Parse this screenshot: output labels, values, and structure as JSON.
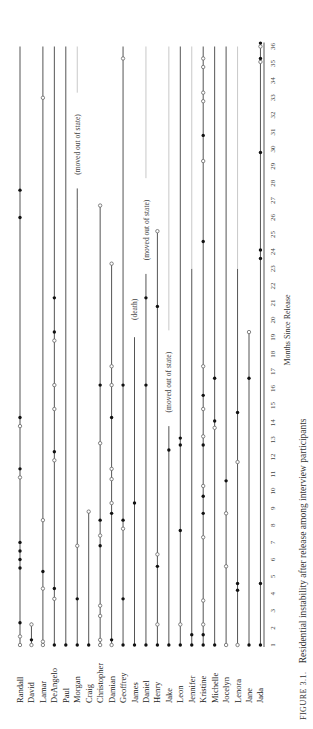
{
  "chart_data": {
    "type": "timeline",
    "title": "FIGURE 3.1. Residential instability after release among interview participants",
    "caption_prefix": "FIGURE 3.1.",
    "caption_text": "Residential instability after release among interview participants",
    "xlabel": "Months Since Release",
    "month_range": [
      1,
      36
    ],
    "ticks": [
      1,
      2,
      3,
      4,
      5,
      6,
      7,
      8,
      9,
      10,
      11,
      12,
      13,
      14,
      15,
      16,
      17,
      18,
      19,
      20,
      21,
      22,
      23,
      24,
      25,
      26,
      27,
      28,
      29,
      30,
      31,
      32,
      33,
      34,
      35,
      36
    ],
    "legend_note": "open circle and filled circle denote different move types",
    "participants": [
      {
        "name": "Randall",
        "end": 36,
        "events": [
          [
            "o",
            1
          ],
          [
            "o",
            1.5
          ],
          [
            "f",
            2.3
          ],
          [
            "f",
            5.5
          ],
          [
            "f",
            6
          ],
          [
            "f",
            6.5
          ],
          [
            "f",
            7
          ],
          [
            "o",
            10.8
          ],
          [
            "f",
            11.3
          ],
          [
            "o",
            13.8
          ],
          [
            "f",
            14.3
          ],
          [
            "f",
            26
          ],
          [
            "f",
            27.6
          ]
        ]
      },
      {
        "name": "David",
        "end": 2.3,
        "events": [
          [
            "o",
            1
          ],
          [
            "f",
            1.3
          ],
          [
            "o",
            2.2
          ]
        ]
      },
      {
        "name": "Lamar",
        "end": 36,
        "events": [
          [
            "o",
            1
          ],
          [
            "o",
            1.2
          ],
          [
            "o",
            4.3
          ],
          [
            "f",
            5.3
          ],
          [
            "o",
            8.3
          ],
          [
            "o",
            33
          ]
        ]
      },
      {
        "name": "DeAngelo",
        "end": 36,
        "events": [
          [
            "f",
            1
          ],
          [
            "o",
            3.7
          ],
          [
            "f",
            4.3
          ],
          [
            "o",
            11.8
          ],
          [
            "f",
            12.3
          ],
          [
            "o",
            14.8
          ],
          [
            "o",
            16.2
          ],
          [
            "o",
            18.8
          ],
          [
            "f",
            19.3
          ],
          [
            "f",
            21.3
          ]
        ]
      },
      {
        "name": "Paul",
        "end": 36,
        "events": [
          [
            "f",
            1
          ]
        ]
      },
      {
        "name": "Morgan",
        "end": 36,
        "fade_after": 26.5,
        "note": "(moved out of state)",
        "note_at": 28.5,
        "events": [
          [
            "f",
            1
          ],
          [
            "f",
            3.7
          ],
          [
            "o",
            6.8
          ]
        ]
      },
      {
        "name": "Craig",
        "end": 8.8,
        "events": [
          [
            "f",
            1
          ],
          [
            "o",
            8.8
          ]
        ]
      },
      {
        "name": "Christopher",
        "end": 26.7,
        "events": [
          [
            "o",
            1
          ],
          [
            "o",
            1.3
          ],
          [
            "o",
            2.7
          ],
          [
            "o",
            3.3
          ],
          [
            "f",
            6.8
          ],
          [
            "o",
            7.4
          ],
          [
            "f",
            8.3
          ],
          [
            "o",
            12.8
          ],
          [
            "f",
            16.2
          ],
          [
            "o",
            26.7
          ]
        ]
      },
      {
        "name": "Damian",
        "end": 23.3,
        "events": [
          [
            "o",
            1
          ],
          [
            "f",
            1.3
          ],
          [
            "f",
            8.7
          ],
          [
            "o",
            9.3
          ],
          [
            "o",
            10.7
          ],
          [
            "o",
            11.3
          ],
          [
            "f",
            14.3
          ],
          [
            "o",
            16.2
          ],
          [
            "o",
            17.3
          ],
          [
            "o",
            23.3
          ]
        ]
      },
      {
        "name": "Geoffrey",
        "end": 36,
        "events": [
          [
            "f",
            1
          ],
          [
            "f",
            3.7
          ],
          [
            "o",
            7.8
          ],
          [
            "f",
            8.3
          ],
          [
            "f",
            16.2
          ],
          [
            "o",
            35.3
          ]
        ]
      },
      {
        "name": "James",
        "end": 19,
        "note": "(death)",
        "note_at": 20,
        "events": [
          [
            "f",
            1
          ],
          [
            "f",
            9.3
          ]
        ]
      },
      {
        "name": "Daniel",
        "end": 36,
        "fade_after": 21.3,
        "note": "(moved out of state)",
        "note_at": 23.5,
        "events": [
          [
            "f",
            1
          ],
          [
            "f",
            16.2
          ],
          [
            "f",
            21.3
          ]
        ]
      },
      {
        "name": "Henry",
        "end": 25.2,
        "events": [
          [
            "f",
            1
          ],
          [
            "o",
            2.2
          ],
          [
            "f",
            5.6
          ],
          [
            "o",
            6.3
          ],
          [
            "f",
            20.8
          ],
          [
            "o",
            25.2
          ]
        ]
      },
      {
        "name": "Jake",
        "end": 36,
        "fade_after": 12.4,
        "note": "(moved out of state)",
        "note_at": 14.6,
        "events": [
          [
            "f",
            1
          ],
          [
            "f",
            12.4
          ]
        ]
      },
      {
        "name": "Leon",
        "end": 36,
        "events": [
          [
            "f",
            1
          ],
          [
            "o",
            2.2
          ],
          [
            "f",
            7.7
          ],
          [
            "f",
            12.7
          ],
          [
            "f",
            13.1
          ]
        ]
      },
      {
        "name": "Jennifer",
        "end": 36,
        "fade_after": 23,
        "events": [
          [
            "f",
            1
          ],
          [
            "f",
            1.6
          ]
        ]
      },
      {
        "name": "Kristine",
        "end": 36,
        "events": [
          [
            "f",
            1
          ],
          [
            "f",
            1.6
          ],
          [
            "o",
            2.2
          ],
          [
            "o",
            3.6
          ],
          [
            "o",
            7.3
          ],
          [
            "f",
            8.7
          ],
          [
            "f",
            9.7
          ],
          [
            "o",
            10.3
          ],
          [
            "f",
            12.7
          ],
          [
            "o",
            13.2
          ],
          [
            "o",
            14.8
          ],
          [
            "f",
            15.6
          ],
          [
            "o",
            17.3
          ],
          [
            "f",
            24.6
          ],
          [
            "o",
            29.3
          ],
          [
            "f",
            30.8
          ],
          [
            "o",
            32.8
          ],
          [
            "o",
            33.3
          ],
          [
            "o",
            34.8
          ],
          [
            "o",
            35.3
          ]
        ]
      },
      {
        "name": "Michelle",
        "end": 36,
        "events": [
          [
            "f",
            1
          ],
          [
            "o",
            13.7
          ],
          [
            "f",
            14.1
          ],
          [
            "f",
            16.6
          ]
        ]
      },
      {
        "name": "Jocelyn",
        "end": 36,
        "events": [
          [
            "o",
            1
          ],
          [
            "o",
            5.6
          ],
          [
            "o",
            8.7
          ],
          [
            "f",
            10.6
          ]
        ]
      },
      {
        "name": "Lenora",
        "end": 36,
        "fade_after": 23,
        "events": [
          [
            "o",
            1
          ],
          [
            "f",
            4.2
          ],
          [
            "f",
            4.6
          ],
          [
            "o",
            11.7
          ],
          [
            "f",
            14.6
          ]
        ]
      },
      {
        "name": "Jane",
        "end": 19.3,
        "events": [
          [
            "f",
            1
          ],
          [
            "f",
            16.6
          ],
          [
            "o",
            19.3
          ]
        ]
      },
      {
        "name": "Jada",
        "end": 36,
        "events": [
          [
            "f",
            1
          ],
          [
            "f",
            4.6
          ],
          [
            "f",
            23.6
          ],
          [
            "f",
            24.1
          ],
          [
            "f",
            29.8
          ],
          [
            "o",
            35.1
          ],
          [
            "f",
            35.3
          ],
          [
            "o",
            36
          ],
          [
            "f",
            36.2
          ]
        ]
      }
    ]
  }
}
